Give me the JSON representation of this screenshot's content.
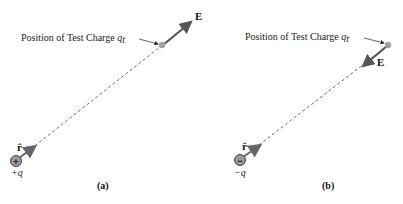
{
  "panels": [
    {
      "id": "a",
      "caption": "(a)",
      "test_charge_label": "Position of Test Charge ",
      "test_charge_symbol": "q",
      "test_charge_subscript": "t",
      "field_label": "E",
      "unit_vector_label": "r̂",
      "source_charge_sign": "+",
      "source_charge_label": "+q",
      "field_direction": "away-from-source"
    },
    {
      "id": "b",
      "caption": "(b)",
      "test_charge_label": "Position of Test Charge ",
      "test_charge_symbol": "q",
      "test_charge_subscript": "t",
      "field_label": "E",
      "unit_vector_label": "r̂",
      "source_charge_sign": "−",
      "source_charge_label": "−q",
      "field_direction": "toward-source"
    }
  ],
  "colors": {
    "arrow": "#555555",
    "dashed_line": "#444444",
    "charge_fill": "#9a9a9a",
    "test_charge_fill": "#a0a0a0",
    "text": "#222222"
  }
}
